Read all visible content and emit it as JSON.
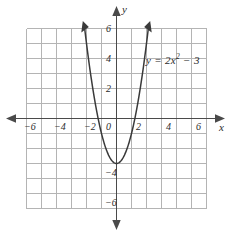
{
  "chart_data": {
    "type": "line",
    "title": "",
    "xlabel": "x",
    "ylabel": "y",
    "equation_label": "y = 2x",
    "equation_exponent": "2",
    "equation_tail": " − 3",
    "function": "y = 2x^2 - 3",
    "xlim": [
      -6,
      6
    ],
    "ylim": [
      -6,
      6
    ],
    "grid": true,
    "grid_step": 1,
    "legend": "none",
    "annotations": [
      "y = 2x² − 3"
    ],
    "vertex": [
      0,
      -3
    ],
    "x_intercepts": [
      -1.22,
      1.22
    ],
    "y_intercept": -3,
    "curve_domain": [
      -2.121,
      2.121
    ],
    "x_ticks": [
      -6,
      -4,
      -2,
      0,
      2,
      4,
      6
    ],
    "x_tick_labels": [
      "−6",
      "−4",
      "−2",
      "0",
      "2",
      "4",
      "6"
    ],
    "y_ticks": [
      6,
      4,
      2,
      0,
      -4,
      -6
    ],
    "y_tick_labels": [
      "6",
      "4",
      "2",
      "0",
      "−4",
      "−6"
    ],
    "series": [
      {
        "name": "y = 2x² − 3",
        "x": [
          -2.121,
          -2.0,
          -1.75,
          -1.5,
          -1.25,
          -1.0,
          -0.75,
          -0.5,
          -0.25,
          0,
          0.25,
          0.5,
          0.75,
          1.0,
          1.25,
          1.5,
          1.75,
          2.0,
          2.121
        ],
        "values": [
          6.0,
          5.0,
          3.125,
          1.5,
          0.125,
          -1.0,
          -1.875,
          -2.5,
          -2.875,
          -3.0,
          -2.875,
          -2.5,
          -1.875,
          -1.0,
          0.125,
          1.5,
          3.125,
          5.0,
          6.0
        ]
      }
    ]
  },
  "axes": {
    "x_axis_name": "x",
    "y_axis_name": "y",
    "origin_label": "0"
  },
  "colors": {
    "grid": "#b4b4b4",
    "axis": "#4a4a4a",
    "curve": "#3a3a3a",
    "text": "#2b2b2b",
    "background": "#ffffff"
  }
}
